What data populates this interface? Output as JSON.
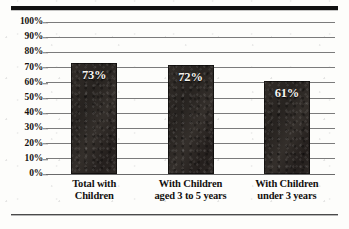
{
  "chart_data": {
    "type": "bar",
    "title": "",
    "xlabel": "",
    "ylabel": "",
    "categories": [
      "Total with Children",
      "With Children aged 3 to 5 years",
      "With Children under 3 years"
    ],
    "category_lines": [
      [
        "Total with",
        "Children"
      ],
      [
        "With Children",
        "aged 3 to 5 years"
      ],
      [
        "With Children",
        "under 3 years"
      ]
    ],
    "values": [
      73,
      72,
      61
    ],
    "value_labels": [
      "73%",
      "72%",
      "61%"
    ],
    "ylim": [
      0,
      100
    ],
    "ytick_values": [
      0,
      10,
      20,
      30,
      40,
      50,
      60,
      70,
      80,
      90,
      100
    ],
    "ytick_labels": [
      "0%",
      "10%",
      "20%",
      "30%",
      "40%",
      "50%",
      "60%",
      "70%",
      "80%",
      "90%",
      "100%"
    ],
    "grid": true,
    "legend": false,
    "legend_position": "none",
    "colors": {
      "bar_fill": "#2b2724",
      "value_label": "#f6f4f0",
      "gridline": "#7b7b7b",
      "axis_text": "#16120f",
      "top_rule": "#111111",
      "bottom_rule": "#4a4a4a",
      "background": "#fdfdfb"
    }
  }
}
